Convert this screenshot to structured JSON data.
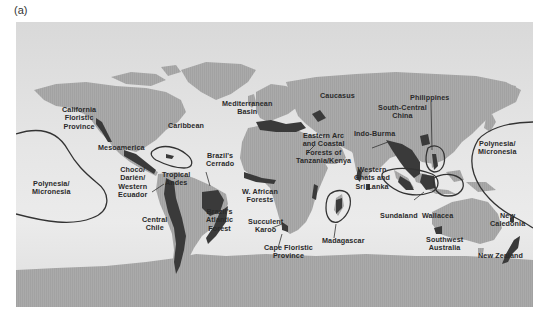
{
  "figure": {
    "panel_label": "(a)"
  },
  "colors": {
    "ocean": "#e4e4e4",
    "land": "#a8a8a8",
    "hotspot": "#3a3a3a",
    "boundary_line": "#333333",
    "label_text": "#2a2a2a"
  },
  "legend": {
    "hotspot_fill": "dark regions = biodiversity hotspots",
    "outline": "outlined areas = island hotspot regions"
  },
  "hotspots": [
    {
      "id": "california",
      "label": "California\nFloristic\nProvince"
    },
    {
      "id": "caribbean",
      "label": "Caribbean"
    },
    {
      "id": "mesoamerica",
      "label": "Mesoamerica"
    },
    {
      "id": "polynesia-west",
      "label": "Polynesia/\nMicronesia"
    },
    {
      "id": "choco",
      "label": "Choco/\nDarién/\nWestern\nEcuador"
    },
    {
      "id": "tropical-andes",
      "label": "Tropical\nAndes"
    },
    {
      "id": "cerrado",
      "label": "Brazil's\nCerrado"
    },
    {
      "id": "central-chile",
      "label": "Central\nChile"
    },
    {
      "id": "atlantic-forest",
      "label": "Brazil's\nAtlantic\nForest"
    },
    {
      "id": "mediterranean",
      "label": "Mediterranean\nBasin"
    },
    {
      "id": "caucasus",
      "label": "Caucasus"
    },
    {
      "id": "eastern-arc",
      "label": "Eastern Arc\nand Coastal\nForests of\nTanzania/Kenya"
    },
    {
      "id": "w-african",
      "label": "W. African\nForests"
    },
    {
      "id": "succulent-karoo",
      "label": "Succulent\nKaroo"
    },
    {
      "id": "cape-floristic",
      "label": "Cape Floristic\nProvince"
    },
    {
      "id": "madagascar",
      "label": "Madagascar"
    },
    {
      "id": "south-central-china",
      "label": "South-Central\nChina"
    },
    {
      "id": "indo-burma",
      "label": "Indo-Burma"
    },
    {
      "id": "western-ghats",
      "label": "Western\nGhats and\nSri Lanka"
    },
    {
      "id": "philippines",
      "label": "Philippines"
    },
    {
      "id": "sundaland",
      "label": "Sundaland"
    },
    {
      "id": "wallacea",
      "label": "Wallacea"
    },
    {
      "id": "polynesia-east",
      "label": "Polynesia/\nMicronesia"
    },
    {
      "id": "southwest-australia",
      "label": "Southwest\nAustralia"
    },
    {
      "id": "new-caledonia",
      "label": "New\nCaledonia"
    },
    {
      "id": "new-zealand",
      "label": "New Zealand"
    }
  ]
}
